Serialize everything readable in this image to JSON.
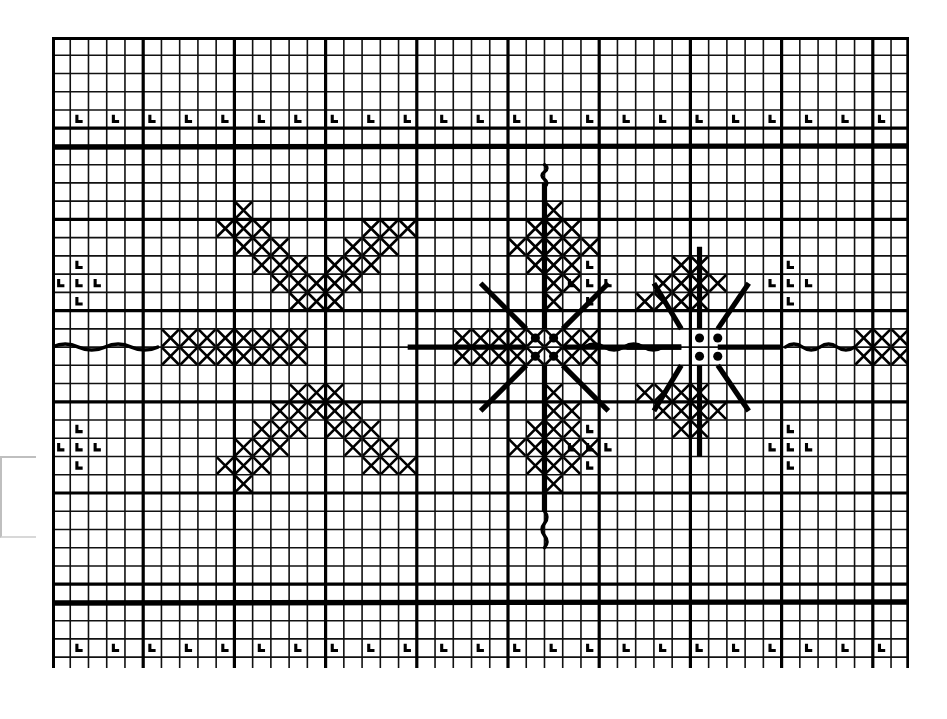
{
  "document": {
    "title": "Cross Stitch Pattern Chart",
    "kind": "needlework-chart",
    "background_color": "#ffffff",
    "ink_color": "#000000"
  },
  "grid": {
    "columns": 47,
    "rows": 35,
    "cell_px": 18.24,
    "origin_x": 0,
    "origin_y": 0,
    "thin_line_color": "#111111",
    "thin_line_width": 1.6,
    "bold_line_color": "#000000",
    "bold_line_width": 3.2,
    "bold_every": 5,
    "border_width": 3.0,
    "heavy_rules": [
      6,
      31
    ],
    "heavy_rule_width": 5.4
  },
  "legend_symbols": {
    "cross": "X",
    "corner_l": "L",
    "dot": "●",
    "backstitch": "line",
    "wave": "squiggle"
  },
  "border_bands": {
    "top_row": 4,
    "bottom_row": 33,
    "symbol": "L",
    "top_count": 24,
    "bottom_count": 23,
    "spacing_columns": 2,
    "top_start_col": 1,
    "bottom_start_col": 1
  },
  "chart_data": {
    "type": "heatmap",
    "xlabel": "",
    "ylabel": "",
    "grid": true,
    "legend_position": "none",
    "cross_cells": [
      [
        10,
        9
      ],
      [
        27,
        9
      ],
      [
        49,
        9
      ],
      [
        9,
        10
      ],
      [
        10,
        10
      ],
      [
        11,
        10
      ],
      [
        17,
        10
      ],
      [
        18,
        10
      ],
      [
        19,
        10
      ],
      [
        26,
        10
      ],
      [
        27,
        10
      ],
      [
        28,
        10
      ],
      [
        48,
        10
      ],
      [
        49,
        10
      ],
      [
        50,
        10
      ],
      [
        10,
        11
      ],
      [
        11,
        11
      ],
      [
        12,
        11
      ],
      [
        16,
        11
      ],
      [
        17,
        11
      ],
      [
        18,
        11
      ],
      [
        25,
        11
      ],
      [
        26,
        11
      ],
      [
        27,
        11
      ],
      [
        28,
        11
      ],
      [
        29,
        11
      ],
      [
        49,
        11
      ],
      [
        50,
        11
      ],
      [
        11,
        12
      ],
      [
        12,
        12
      ],
      [
        13,
        12
      ],
      [
        15,
        12
      ],
      [
        16,
        12
      ],
      [
        17,
        12
      ],
      [
        26,
        12
      ],
      [
        27,
        12
      ],
      [
        28,
        12
      ],
      [
        34,
        12
      ],
      [
        35,
        12
      ],
      [
        50,
        12
      ],
      [
        12,
        13
      ],
      [
        13,
        13
      ],
      [
        14,
        13
      ],
      [
        15,
        13
      ],
      [
        16,
        13
      ],
      [
        27,
        13
      ],
      [
        28,
        13
      ],
      [
        33,
        13
      ],
      [
        34,
        13
      ],
      [
        35,
        13
      ],
      [
        36,
        13
      ],
      [
        13,
        14
      ],
      [
        14,
        14
      ],
      [
        15,
        14
      ],
      [
        27,
        14
      ],
      [
        32,
        14
      ],
      [
        33,
        14
      ],
      [
        34,
        14
      ],
      [
        35,
        14
      ],
      [
        6,
        16
      ],
      [
        7,
        16
      ],
      [
        8,
        16
      ],
      [
        9,
        16
      ],
      [
        10,
        16
      ],
      [
        11,
        16
      ],
      [
        12,
        16
      ],
      [
        13,
        16
      ],
      [
        22,
        16
      ],
      [
        23,
        16
      ],
      [
        24,
        16
      ],
      [
        25,
        16
      ],
      [
        26,
        16
      ],
      [
        27,
        16
      ],
      [
        28,
        16
      ],
      [
        29,
        16
      ],
      [
        44,
        16
      ],
      [
        45,
        16
      ],
      [
        46,
        16
      ],
      [
        6,
        17
      ],
      [
        7,
        17
      ],
      [
        8,
        17
      ],
      [
        9,
        17
      ],
      [
        10,
        17
      ],
      [
        11,
        17
      ],
      [
        12,
        17
      ],
      [
        13,
        17
      ],
      [
        22,
        17
      ],
      [
        23,
        17
      ],
      [
        24,
        17
      ],
      [
        25,
        17
      ],
      [
        26,
        17
      ],
      [
        27,
        17
      ],
      [
        28,
        17
      ],
      [
        29,
        17
      ],
      [
        44,
        17
      ],
      [
        45,
        17
      ],
      [
        46,
        17
      ],
      [
        13,
        19
      ],
      [
        14,
        19
      ],
      [
        15,
        19
      ],
      [
        27,
        19
      ],
      [
        32,
        19
      ],
      [
        33,
        19
      ],
      [
        34,
        19
      ],
      [
        35,
        19
      ],
      [
        12,
        20
      ],
      [
        13,
        20
      ],
      [
        14,
        20
      ],
      [
        15,
        20
      ],
      [
        16,
        20
      ],
      [
        27,
        20
      ],
      [
        28,
        20
      ],
      [
        33,
        20
      ],
      [
        34,
        20
      ],
      [
        35,
        20
      ],
      [
        36,
        20
      ],
      [
        11,
        21
      ],
      [
        12,
        21
      ],
      [
        13,
        21
      ],
      [
        15,
        21
      ],
      [
        16,
        21
      ],
      [
        17,
        21
      ],
      [
        26,
        21
      ],
      [
        27,
        21
      ],
      [
        28,
        21
      ],
      [
        34,
        21
      ],
      [
        35,
        21
      ],
      [
        50,
        21
      ],
      [
        10,
        22
      ],
      [
        11,
        22
      ],
      [
        12,
        22
      ],
      [
        16,
        22
      ],
      [
        17,
        22
      ],
      [
        18,
        22
      ],
      [
        25,
        22
      ],
      [
        26,
        22
      ],
      [
        27,
        22
      ],
      [
        28,
        22
      ],
      [
        29,
        22
      ],
      [
        49,
        22
      ],
      [
        50,
        22
      ],
      [
        9,
        23
      ],
      [
        10,
        23
      ],
      [
        11,
        23
      ],
      [
        17,
        23
      ],
      [
        18,
        23
      ],
      [
        19,
        23
      ],
      [
        26,
        23
      ],
      [
        27,
        23
      ],
      [
        28,
        23
      ],
      [
        48,
        23
      ],
      [
        49,
        23
      ],
      [
        50,
        23
      ],
      [
        10,
        24
      ],
      [
        27,
        24
      ],
      [
        49,
        24
      ]
    ],
    "dot_cells": [
      [
        26,
        16
      ],
      [
        27,
        16
      ],
      [
        26,
        17
      ],
      [
        27,
        17
      ],
      [
        35,
        16
      ],
      [
        36,
        16
      ],
      [
        35,
        17
      ],
      [
        36,
        17
      ]
    ],
    "l_cells_border_top": [
      [
        1,
        4
      ],
      [
        3,
        4
      ],
      [
        5,
        4
      ],
      [
        7,
        4
      ],
      [
        9,
        4
      ],
      [
        11,
        4
      ],
      [
        13,
        4
      ],
      [
        15,
        4
      ],
      [
        17,
        4
      ],
      [
        19,
        4
      ],
      [
        21,
        4
      ],
      [
        23,
        4
      ],
      [
        25,
        4
      ],
      [
        27,
        4
      ],
      [
        29,
        4
      ],
      [
        31,
        4
      ],
      [
        33,
        4
      ],
      [
        35,
        4
      ],
      [
        37,
        4
      ],
      [
        39,
        4
      ],
      [
        41,
        4
      ],
      [
        43,
        4
      ],
      [
        45,
        4
      ]
    ],
    "l_cells_border_bottom": [
      [
        1,
        33
      ],
      [
        3,
        33
      ],
      [
        5,
        33
      ],
      [
        7,
        33
      ],
      [
        9,
        33
      ],
      [
        11,
        33
      ],
      [
        13,
        33
      ],
      [
        15,
        33
      ],
      [
        17,
        33
      ],
      [
        19,
        33
      ],
      [
        21,
        33
      ],
      [
        23,
        33
      ],
      [
        25,
        33
      ],
      [
        27,
        33
      ],
      [
        29,
        33
      ],
      [
        31,
        33
      ],
      [
        33,
        33
      ],
      [
        35,
        33
      ],
      [
        37,
        33
      ],
      [
        39,
        33
      ],
      [
        41,
        33
      ],
      [
        43,
        33
      ],
      [
        45,
        33
      ]
    ],
    "l_cluster_cells": [
      [
        1,
        12
      ],
      [
        0,
        13
      ],
      [
        1,
        13
      ],
      [
        2,
        13
      ],
      [
        1,
        14
      ],
      [
        29,
        12
      ],
      [
        28,
        13
      ],
      [
        29,
        13
      ],
      [
        30,
        13
      ],
      [
        29,
        14
      ],
      [
        40,
        12
      ],
      [
        39,
        13
      ],
      [
        40,
        13
      ],
      [
        41,
        13
      ],
      [
        40,
        14
      ],
      [
        1,
        21
      ],
      [
        0,
        22
      ],
      [
        1,
        22
      ],
      [
        2,
        22
      ],
      [
        1,
        23
      ],
      [
        29,
        21
      ],
      [
        28,
        22
      ],
      [
        29,
        22
      ],
      [
        30,
        22
      ],
      [
        29,
        23
      ],
      [
        40,
        21
      ],
      [
        39,
        22
      ],
      [
        40,
        22
      ],
      [
        41,
        22
      ],
      [
        40,
        23
      ]
    ],
    "backstitch_segments": [
      {
        "x1": 27,
        "y1": 8.0,
        "x2": 27,
        "y2": 16.0,
        "weight": "heavy"
      },
      {
        "x1": 27,
        "y1": 18.0,
        "x2": 27,
        "y2": 26.0,
        "weight": "heavy"
      },
      {
        "x1": 19.5,
        "y1": 17.0,
        "x2": 26.0,
        "y2": 17.0,
        "weight": "heavy"
      },
      {
        "x1": 28.0,
        "y1": 17.0,
        "x2": 34.5,
        "y2": 17.0,
        "weight": "heavy"
      },
      {
        "x1": 23.5,
        "y1": 13.5,
        "x2": 26.0,
        "y2": 16.0,
        "weight": "heavy"
      },
      {
        "x1": 28.0,
        "y1": 16.0,
        "x2": 30.5,
        "y2": 13.5,
        "weight": "heavy"
      },
      {
        "x1": 23.5,
        "y1": 20.5,
        "x2": 26.0,
        "y2": 18.0,
        "weight": "heavy"
      },
      {
        "x1": 28.0,
        "y1": 18.0,
        "x2": 30.5,
        "y2": 20.5,
        "weight": "heavy"
      },
      {
        "x1": 35.5,
        "y1": 11.5,
        "x2": 35.5,
        "y2": 16.0,
        "weight": "heavy"
      },
      {
        "x1": 35.5,
        "y1": 18.0,
        "x2": 35.5,
        "y2": 23.0,
        "weight": "heavy"
      },
      {
        "x1": 31.5,
        "y1": 17.0,
        "x2": 34.5,
        "y2": 17.0,
        "weight": "heavy"
      },
      {
        "x1": 36.5,
        "y1": 17.0,
        "x2": 40.0,
        "y2": 17.0,
        "weight": "heavy"
      },
      {
        "x1": 33.0,
        "y1": 13.5,
        "x2": 34.5,
        "y2": 16.0,
        "weight": "heavy"
      },
      {
        "x1": 36.5,
        "y1": 16.0,
        "x2": 38.2,
        "y2": 13.5,
        "weight": "heavy"
      },
      {
        "x1": 33.0,
        "y1": 20.5,
        "x2": 34.5,
        "y2": 18.0,
        "weight": "heavy"
      },
      {
        "x1": 36.5,
        "y1": 18.0,
        "x2": 38.2,
        "y2": 20.5,
        "weight": "heavy"
      }
    ],
    "wave_segments": [
      {
        "x1": 0.0,
        "y1": 17.0,
        "x2": 5.8,
        "y2": 17.0
      },
      {
        "x1": 29.2,
        "y1": 17.0,
        "x2": 33.5,
        "y2": 17.0
      },
      {
        "x1": 40.2,
        "y1": 17.0,
        "x2": 44.0,
        "y2": 17.0
      },
      {
        "x1": 27.0,
        "y1": 7.0,
        "x2": 27.0,
        "y2": 8.2,
        "vertical": true
      },
      {
        "x1": 27.0,
        "y1": 26.0,
        "x2": 27.0,
        "y2": 28.0,
        "vertical": true
      }
    ],
    "annotations": [
      "Top and bottom borders carry a repeating corner-L motif every 2 squares.",
      "Two heavy horizontal rules separate the border bands from the central field.",
      "Large eight-point snowflake centered near column 27, row 17.",
      "Smaller eight-point star centered near column 35.5, row 17.",
      "Partial snowflake repeat clipped at the right edge of the chart."
    ]
  }
}
